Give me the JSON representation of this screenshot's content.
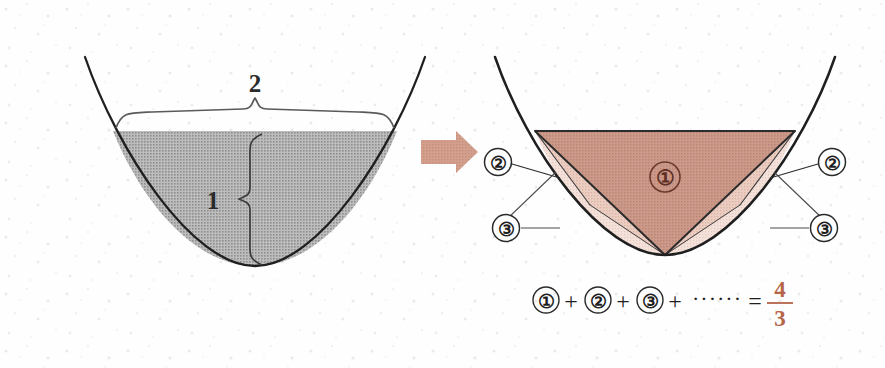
{
  "figure": {
    "background_color": "#fefefe",
    "texture": "speckled-paper"
  },
  "left_panel": {
    "name": "parabolic-segment-with-dimensions",
    "curve_color": "#1f1f1f",
    "fill_color": "#a8a8a8",
    "fill_label": "gray-halftone",
    "width_brace": {
      "label": "2",
      "orientation": "horizontal",
      "meaning": "chord-width"
    },
    "height_brace": {
      "label": "1",
      "orientation": "vertical",
      "meaning": "segment-depth"
    }
  },
  "arrow": {
    "name": "transform-arrow",
    "direction": "right",
    "color": "#cf9a87"
  },
  "right_panel": {
    "name": "inscribed-triangle-decomposition",
    "curve_color": "#1f1f1f",
    "triangle_1": {
      "label": "①",
      "fill_color": "#c89382",
      "text_color": "#5e2f24"
    },
    "triangle_2": {
      "label": "②",
      "fill_color": "#e8c5b8",
      "count": 2,
      "callout_color": "#2a2a2a"
    },
    "triangle_3": {
      "label": "③",
      "fill_color": "#f2ded6",
      "count": 2,
      "callout_color": "#2a2a2a"
    },
    "callouts": [
      {
        "label": "②",
        "side": "left"
      },
      {
        "label": "②",
        "side": "right"
      },
      {
        "label": "③",
        "side": "left"
      },
      {
        "label": "③",
        "side": "right"
      }
    ]
  },
  "equation": {
    "name": "series-sum-equation",
    "terms": [
      "①",
      "+",
      "②",
      "+",
      "③",
      "+",
      "······",
      "="
    ],
    "term_1": "①",
    "plus_1": "+",
    "term_2": "②",
    "plus_2": "+",
    "term_3": "③",
    "plus_3": "+",
    "ellipsis": "······",
    "equals": "=",
    "fraction_numerator": "4",
    "fraction_denominator": "3",
    "fraction_color": "#b5654a",
    "text_color": "#2a2a2a"
  }
}
